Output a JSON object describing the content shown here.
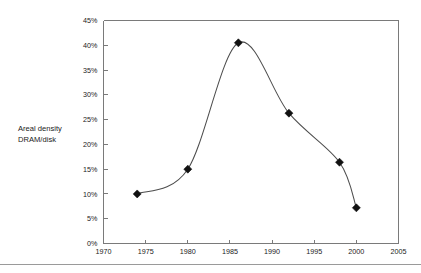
{
  "chart_data": {
    "type": "line",
    "title": "",
    "subtitle": "",
    "xlabel": "",
    "ylabel": "Areal density DRAM/disk",
    "ylabel_lines": [
      "Areal density",
      "DRAM/disk"
    ],
    "xlim": [
      1970,
      2005
    ],
    "ylim": [
      0,
      45
    ],
    "grid": false,
    "legend": null,
    "y_unit": "%",
    "x_ticks": [
      1970,
      1975,
      1980,
      1985,
      1990,
      1995,
      2000,
      2005
    ],
    "x_tick_labels": [
      "1970",
      "1975",
      "1980",
      "1985",
      "1990",
      "1995",
      "2000",
      "2005"
    ],
    "y_ticks": [
      0,
      5,
      10,
      15,
      20,
      25,
      30,
      35,
      40,
      45
    ],
    "y_tick_labels": [
      "0%",
      "5%",
      "10%",
      "15%",
      "20%",
      "25%",
      "30%",
      "35%",
      "40%",
      "45%"
    ],
    "series": [
      {
        "name": "Areal density DRAM/disk",
        "marker": "diamond",
        "color": "#111111",
        "line_color": "#4d4d4d",
        "x": [
          1974,
          1980,
          1986,
          1992,
          1998,
          2000
        ],
        "values": [
          10.0,
          15.0,
          40.5,
          26.3,
          16.4,
          7.2
        ]
      }
    ],
    "points": [
      {
        "year": 1974,
        "value": 10.0,
        "label": "10%"
      },
      {
        "year": 1980,
        "value": 15.0,
        "label": "15%"
      },
      {
        "year": 1986,
        "value": 40.5,
        "label": "40.5%"
      },
      {
        "year": 1992,
        "value": 26.3,
        "label": "26.3%"
      },
      {
        "year": 1998,
        "value": 16.4,
        "label": "16.4%"
      },
      {
        "year": 2000,
        "value": 7.2,
        "label": "7.2%"
      }
    ]
  },
  "figure": {
    "background_color": "#ffffff",
    "frame_color": "#7a7a7a",
    "text_color": "#1a1a1a",
    "footer_rule_color": "#9a9a9a"
  }
}
